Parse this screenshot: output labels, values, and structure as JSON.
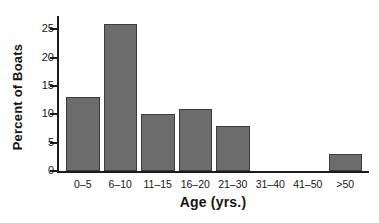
{
  "chart_data": {
    "type": "bar",
    "title": "",
    "xlabel": "Age (yrs.)",
    "ylabel": "Percent of Boats",
    "categories": [
      "0–5",
      "6–10",
      "11–15",
      "16–20",
      "21–30",
      "31–40",
      "41–50",
      ">50"
    ],
    "values": [
      13,
      26,
      10,
      11,
      8,
      0,
      0,
      3
    ],
    "ylim": [
      0,
      27
    ],
    "yticks": [
      0,
      5,
      10,
      15,
      20,
      25
    ],
    "ytick_labels": [
      "0",
      "5",
      "10",
      "15",
      "20",
      "25"
    ],
    "grid": false,
    "legend": null,
    "bar_color": "#6c6c6c",
    "bar_edge_color": "#3c3c3c",
    "axis_color": "#1b1b1b",
    "background": "#ffffff"
  }
}
